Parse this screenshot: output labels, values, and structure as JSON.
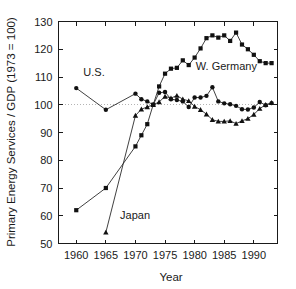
{
  "chart_data": {
    "type": "line",
    "title": "",
    "xlabel": "Year",
    "ylabel": "Primary Energy Services / GDP (1973 = 100)",
    "xlim": [
      1957,
      1994
    ],
    "ylim": [
      50,
      130
    ],
    "xticks": [
      1960,
      1965,
      1970,
      1975,
      1980,
      1985,
      1990
    ],
    "yticks": [
      50,
      60,
      70,
      80,
      90,
      100,
      110,
      120,
      130
    ],
    "grid": false,
    "reference_line": {
      "y": 100,
      "style": "dotted",
      "color": "#b4b4b4"
    },
    "legend_position": "inline-annotations",
    "annotations": [
      {
        "text": "U.S.",
        "x": 1961.2,
        "y": 110.3
      },
      {
        "text": "Japan",
        "x": 1967.4,
        "y": 59.0
      },
      {
        "text": "W. Germany",
        "x": 1980.2,
        "y": 112.6
      }
    ],
    "series": [
      {
        "name": "U.S.",
        "marker": "circle",
        "x": [
          1960,
          1965,
          1970,
          1971,
          1972,
          1973,
          1974,
          1975,
          1976,
          1977,
          1978,
          1979,
          1980,
          1981,
          1982,
          1983,
          1984,
          1985,
          1986,
          1987,
          1988,
          1989,
          1990,
          1991,
          1992,
          1993
        ],
        "values": [
          106.0,
          98.2,
          104.0,
          102.0,
          101.2,
          100.0,
          104.3,
          104.6,
          102.0,
          101.7,
          101.2,
          99.2,
          102.6,
          102.6,
          103.2,
          106.3,
          101.2,
          100.5,
          100.2,
          99.6,
          98.4,
          98.3,
          99.0,
          101.0,
          99.8,
          100.6
        ]
      },
      {
        "name": "Japan",
        "marker": "triangle",
        "x": [
          1965,
          1970,
          1971,
          1972,
          1973,
          1974,
          1975,
          1976,
          1977,
          1978,
          1979,
          1980,
          1981,
          1982,
          1983,
          1984,
          1985,
          1986,
          1987,
          1988,
          1989,
          1990,
          1991,
          1992,
          1993
        ],
        "values": [
          54.0,
          96.1,
          98.4,
          99.2,
          100.0,
          101.0,
          103.0,
          102.4,
          103.3,
          102.0,
          101.4,
          99.4,
          98.2,
          96.6,
          94.6,
          94.0,
          94.0,
          94.2,
          93.2,
          94.2,
          95.0,
          96.5,
          98.6,
          100.0,
          100.7
        ]
      },
      {
        "name": "W. Germany",
        "marker": "square",
        "x": [
          1960,
          1965,
          1970,
          1971,
          1972,
          1973,
          1974,
          1975,
          1976,
          1977,
          1978,
          1979,
          1980,
          1981,
          1982,
          1983,
          1984,
          1985,
          1986,
          1987,
          1988,
          1989,
          1990,
          1991,
          1992,
          1993
        ],
        "values": [
          62.0,
          70.0,
          85.0,
          89.0,
          93.0,
          100.0,
          106.6,
          111.2,
          113.0,
          113.3,
          116.0,
          114.3,
          117.0,
          120.3,
          124.0,
          125.0,
          124.2,
          125.0,
          123.0,
          126.0,
          121.7,
          120.0,
          118.0,
          115.7,
          115.0,
          115.0
        ]
      }
    ]
  }
}
